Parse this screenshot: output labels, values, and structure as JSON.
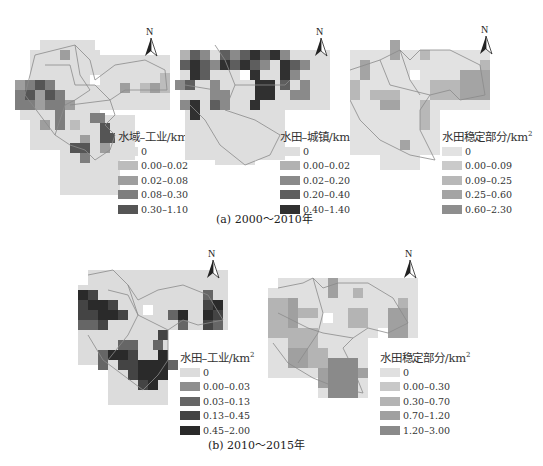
{
  "figure": {
    "caption_a": "(a) 2000～2010年",
    "caption_b": "(b) 2010～2015年",
    "north_label": "N"
  },
  "panels": [
    {
      "id": "a1",
      "legend_title": "水域–工业/km",
      "legend_unit_sup": "2",
      "classes": [
        {
          "label": "0",
          "color": "#dedede"
        },
        {
          "label": "0.00–0.02",
          "color": "#bcbcbc"
        },
        {
          "label": "0.02–0.08",
          "color": "#9e9e9e"
        },
        {
          "label": "0.08–0.30",
          "color": "#7e7e7e"
        },
        {
          "label": "0.30–1.10",
          "color": "#555555"
        }
      ]
    },
    {
      "id": "a2",
      "legend_title": "水田–城镇/km",
      "legend_unit_sup": "2",
      "classes": [
        {
          "label": "0",
          "color": "#dedede"
        },
        {
          "label": "0.00–0.02",
          "color": "#b2b2b2"
        },
        {
          "label": "0.02–0.20",
          "color": "#8a8a8a"
        },
        {
          "label": "0.20–0.40",
          "color": "#5e5e5e"
        },
        {
          "label": "0.40–1.40",
          "color": "#303030"
        }
      ]
    },
    {
      "id": "a3",
      "legend_title": "水田稳定部分/km",
      "legend_unit_sup": "2",
      "classes": [
        {
          "label": "0",
          "color": "#e2e2e2"
        },
        {
          "label": "0.00–0.09",
          "color": "#cacaca"
        },
        {
          "label": "0.09–0.25",
          "color": "#b8b8b8"
        },
        {
          "label": "0.25–0.60",
          "color": "#a4a4a4"
        },
        {
          "label": "0.60–2.30",
          "color": "#8e8e8e"
        }
      ]
    },
    {
      "id": "b1",
      "legend_title": "水田–工业/km",
      "legend_unit_sup": "2",
      "classes": [
        {
          "label": "0",
          "color": "#dcdcdc"
        },
        {
          "label": "0.00–0.03",
          "color": "#8e8e8e"
        },
        {
          "label": "0.03–0.13",
          "color": "#666666"
        },
        {
          "label": "0.13–0.45",
          "color": "#444444"
        },
        {
          "label": "0.45–2.00",
          "color": "#2a2a2a"
        }
      ]
    },
    {
      "id": "b2",
      "legend_title": "水田稳定部分/km",
      "legend_unit_sup": "2",
      "classes": [
        {
          "label": "0",
          "color": "#e0e0e0"
        },
        {
          "label": "0.00–0.30",
          "color": "#c8c8c8"
        },
        {
          "label": "0.30–0.70",
          "color": "#b4b4b4"
        },
        {
          "label": "0.70–1.20",
          "color": "#a0a0a0"
        },
        {
          "label": "1.20–3.00",
          "color": "#8a8a8a"
        }
      ]
    }
  ]
}
